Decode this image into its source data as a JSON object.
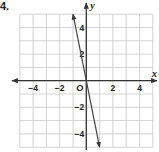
{
  "problem": {
    "number": "4."
  },
  "chart_data": {
    "type": "line",
    "title": "",
    "xlabel": "x",
    "ylabel": "y",
    "origin_label": "O",
    "xlim": [
      -5,
      5
    ],
    "ylim": [
      -5,
      5
    ],
    "grid": true,
    "x_ticks": [
      -4,
      -2,
      2,
      4
    ],
    "x_tick_labels": [
      "−4",
      "−2",
      "2",
      "4"
    ],
    "y_ticks": [
      4,
      2,
      -2,
      -4
    ],
    "y_tick_labels": [
      "4",
      "2",
      "−2",
      "−4"
    ],
    "series": [
      {
        "name": "line",
        "equation": "y = -5x",
        "x": [
          -1,
          1
        ],
        "y": [
          5,
          -5
        ],
        "arrows": "both"
      }
    ],
    "colors": {
      "grid": "#c8c8c8",
      "axis": "#333333",
      "line": "#444444"
    }
  }
}
